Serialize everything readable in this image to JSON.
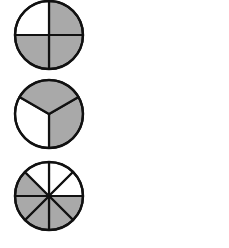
{
  "diagram": {
    "colors": {
      "shaded": "#a9a9a9",
      "unshaded": "#ffffff",
      "stroke": "#111111",
      "background": "#ffffff"
    },
    "circles": [
      {
        "name": "quarters",
        "cx": 49,
        "cy": 35,
        "r": 34,
        "slices": 4,
        "start_angle": -90,
        "shaded": [
          0,
          1,
          2
        ],
        "unshaded": [
          3
        ],
        "fraction": "3/4"
      },
      {
        "name": "thirds",
        "cx": 49,
        "cy": 114,
        "r": 34,
        "slices": 3,
        "start_angle": -30,
        "shaded": [
          2,
          0
        ],
        "unshaded": [
          1
        ],
        "fraction": "2/3"
      },
      {
        "name": "eighths",
        "cx": 49,
        "cy": 196,
        "r": 34,
        "slices": 8,
        "start_angle": -90,
        "shaded": [
          2,
          3,
          4,
          5,
          6
        ],
        "unshaded": [
          7,
          0,
          1
        ],
        "fraction": "5/8"
      }
    ]
  }
}
